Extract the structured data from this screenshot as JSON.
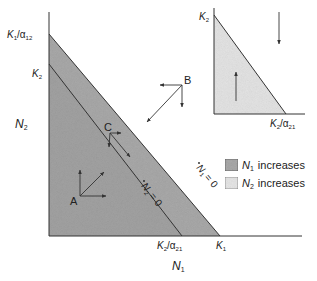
{
  "main": {
    "y_axis_label": "N",
    "y_axis_sub": "2",
    "x_axis_label": "N",
    "x_axis_sub": "1",
    "y_ticks": [
      {
        "main": "K",
        "sub": "1",
        "rest": "/α",
        "rest_sub": "12"
      },
      {
        "main": "K",
        "sub": "2"
      }
    ],
    "x_ticks": [
      {
        "main": "K",
        "sub": "2",
        "rest": "/α",
        "rest_sub": "21"
      },
      {
        "main": "K",
        "sub": "1"
      }
    ],
    "isoclines": [
      {
        "label": "N",
        "sub": "1",
        "eq": "= 0"
      },
      {
        "label": "N",
        "sub": "2",
        "eq": "= 0"
      }
    ],
    "points": [
      "A",
      "B",
      "C"
    ]
  },
  "inset": {
    "y_tick": {
      "main": "K",
      "sub": "2"
    },
    "x_tick": {
      "main": "K",
      "sub": "2",
      "rest": "/α",
      "rest_sub": "21"
    }
  },
  "legend": [
    {
      "symbol": "N",
      "sub": "1",
      "text": "increases",
      "color": "#a9a9a9"
    },
    {
      "symbol": "N",
      "sub": "2",
      "text": "increases",
      "color": "#e6e6e6"
    }
  ],
  "colors": {
    "n1_shade": "#a9a9a9",
    "n2_shade": "#e4e4e4",
    "line": "#333333"
  }
}
